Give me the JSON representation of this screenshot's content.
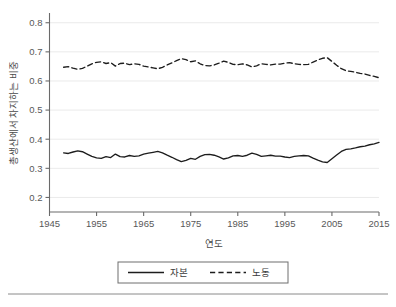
{
  "chart_data": {
    "type": "line",
    "title": "",
    "xlabel": "연도",
    "ylabel": "총생산에서 차지하는 비중",
    "xlim": [
      1945,
      2015
    ],
    "ylim": [
      0.15,
      0.83
    ],
    "xticks": [
      1945,
      1955,
      1965,
      1975,
      1985,
      1995,
      2005,
      2015
    ],
    "xtick_labels": [
      "1945",
      "1955",
      "1965",
      "1975",
      "1985",
      "1995",
      "2005",
      "2015"
    ],
    "yticks": [
      0.2,
      0.3,
      0.4,
      0.5,
      0.6,
      0.7,
      0.8
    ],
    "ytick_labels": [
      "0.2",
      "0.3",
      "0.4",
      "0.5",
      "0.6",
      "0.7",
      "0.8"
    ],
    "grid": "horizontal",
    "legend_position": "below-plot",
    "x": [
      1948,
      1949,
      1950,
      1951,
      1952,
      1953,
      1954,
      1955,
      1956,
      1957,
      1958,
      1959,
      1960,
      1961,
      1962,
      1963,
      1964,
      1965,
      1966,
      1967,
      1968,
      1969,
      1970,
      1971,
      1972,
      1973,
      1974,
      1975,
      1976,
      1977,
      1978,
      1979,
      1980,
      1981,
      1982,
      1983,
      1984,
      1985,
      1986,
      1987,
      1988,
      1989,
      1990,
      1991,
      1992,
      1993,
      1994,
      1995,
      1996,
      1997,
      1998,
      1999,
      2000,
      2001,
      2002,
      2003,
      2004,
      2005,
      2006,
      2007,
      2008,
      2009,
      2010,
      2011,
      2012
    ],
    "series": [
      {
        "name": "자본",
        "style": "solid",
        "color": "#1d1d1d",
        "values": [
          0.353,
          0.351,
          0.356,
          0.36,
          0.357,
          0.349,
          0.341,
          0.336,
          0.334,
          0.34,
          0.337,
          0.349,
          0.34,
          0.339,
          0.344,
          0.341,
          0.343,
          0.349,
          0.352,
          0.355,
          0.358,
          0.353,
          0.345,
          0.338,
          0.33,
          0.323,
          0.327,
          0.334,
          0.331,
          0.341,
          0.347,
          0.348,
          0.345,
          0.339,
          0.332,
          0.336,
          0.343,
          0.344,
          0.341,
          0.345,
          0.352,
          0.348,
          0.341,
          0.343,
          0.345,
          0.342,
          0.342,
          0.339,
          0.337,
          0.341,
          0.343,
          0.344,
          0.343,
          0.335,
          0.328,
          0.322,
          0.32,
          0.333,
          0.346,
          0.358,
          0.365,
          0.367,
          0.37,
          0.374,
          0.376
        ],
        "last_values": [
          0.381,
          0.384,
          0.389
        ]
      },
      {
        "name": "노동",
        "style": "dashed",
        "color": "#1d1d1d",
        "values": [
          0.647,
          0.649,
          0.644,
          0.64,
          0.643,
          0.651,
          0.659,
          0.664,
          0.666,
          0.66,
          0.663,
          0.651,
          0.66,
          0.661,
          0.656,
          0.659,
          0.657,
          0.651,
          0.648,
          0.645,
          0.642,
          0.647,
          0.655,
          0.662,
          0.67,
          0.677,
          0.673,
          0.666,
          0.669,
          0.659,
          0.653,
          0.652,
          0.655,
          0.661,
          0.668,
          0.664,
          0.657,
          0.656,
          0.659,
          0.655,
          0.648,
          0.652,
          0.659,
          0.657,
          0.655,
          0.658,
          0.658,
          0.661,
          0.663,
          0.659,
          0.657,
          0.656,
          0.657,
          0.665,
          0.672,
          0.678,
          0.68,
          0.667,
          0.654,
          0.642,
          0.635,
          0.633,
          0.63,
          0.626,
          0.624
        ],
        "last_values": [
          0.619,
          0.616,
          0.611
        ]
      }
    ]
  },
  "legend": {
    "entries": [
      {
        "label": "자본",
        "style": "solid"
      },
      {
        "label": "노동",
        "style": "dashed"
      }
    ]
  }
}
